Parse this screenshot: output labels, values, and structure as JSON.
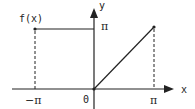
{
  "diagram": {
    "function_label": "f(x)",
    "y_axis_label": "y",
    "x_axis_label": "x",
    "y_tick_label": "π",
    "x_ticks": [
      {
        "label": "−π",
        "value": "-pi"
      },
      {
        "label": "0",
        "value": "0"
      },
      {
        "label": "π",
        "value": "pi"
      }
    ],
    "segments": [
      {
        "name": "constant-segment",
        "from": [
          "-pi",
          "pi"
        ],
        "to": [
          "0",
          "pi"
        ],
        "style": "solid"
      },
      {
        "name": "linear-segment",
        "from": [
          "0",
          "0"
        ],
        "to": [
          "pi",
          "pi"
        ],
        "style": "solid"
      },
      {
        "name": "left-dashed-guide",
        "x": "-pi",
        "style": "dashed"
      },
      {
        "name": "right-dashed-guide",
        "x": "pi",
        "style": "dashed"
      }
    ],
    "colors": {
      "line": "#222222",
      "background": "#ffffff"
    }
  }
}
